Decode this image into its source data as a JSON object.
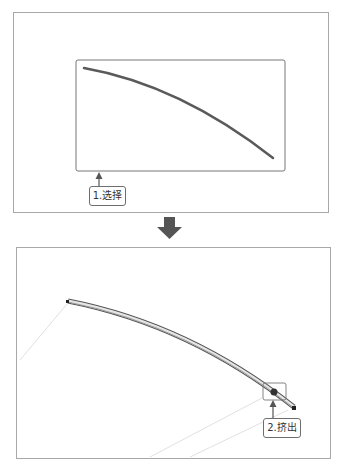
{
  "steps": [
    {
      "number": "1",
      "label": "1.选择",
      "description": "select sketch curve"
    },
    {
      "number": "2",
      "label": "2.挤出",
      "description": "extrude along curve"
    }
  ],
  "colors": {
    "frame_border": "#a8a8a8",
    "curve": "#5a5a5a",
    "arrow": "#555555",
    "callout_border": "#6e6e6e"
  },
  "flow_arrow": {
    "icon": "down-arrow-icon"
  }
}
